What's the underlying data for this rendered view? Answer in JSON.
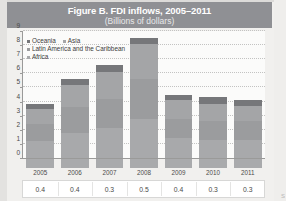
{
  "figure": {
    "title": "Figure B. FDI inflows, 2005–2011",
    "subtitle": "(Billions of dollars)"
  },
  "legend": {
    "items": [
      {
        "label": "Oceania",
        "color": "#76777a"
      },
      {
        "label": "Asia",
        "color": "#a4a5a7"
      },
      {
        "label": "Latin America and the Caribbean",
        "color": "#9b9c9e"
      },
      {
        "label": "Africa",
        "color": "#a8a9ab"
      }
    ]
  },
  "y_axis": {
    "ticks": [
      "9",
      "8",
      "7",
      "6",
      "5",
      "4",
      "3",
      "2",
      "1",
      "0"
    ]
  },
  "bottom_row": {
    "values": [
      "0.4",
      "0.4",
      "0.3",
      "0.5",
      "0.4",
      "0.3",
      "0.3"
    ]
  },
  "corner": {
    "scrap": "S"
  },
  "chart_data": {
    "type": "bar",
    "title": "Figure B. FDI inflows, 2005–2011",
    "subtitle": "(Billions of dollars)",
    "xlabel": "",
    "ylabel": "Billions of dollars",
    "ylim": [
      0,
      9
    ],
    "grid": true,
    "stacked": true,
    "legend_position": "inside-top-left",
    "categories": [
      "2005",
      "2006",
      "2007",
      "2008",
      "2009",
      "2010",
      "2011"
    ],
    "series": [
      {
        "name": "Africa",
        "values": [
          1.2,
          1.8,
          2.1,
          2.8,
          1.4,
          1.3,
          1.3
        ]
      },
      {
        "name": "Latin America and the Caribbean",
        "values": [
          1.2,
          1.8,
          2.1,
          2.8,
          1.4,
          1.3,
          1.3
        ]
      },
      {
        "name": "Asia",
        "values": [
          1.1,
          1.6,
          1.9,
          2.5,
          1.3,
          1.2,
          1.1
        ]
      },
      {
        "name": "Oceania",
        "values": [
          0.3,
          0.4,
          0.5,
          0.4,
          0.4,
          0.5,
          0.4
        ]
      }
    ],
    "totals": [
      3.8,
      5.6,
      6.6,
      8.5,
      4.5,
      4.3,
      4.1
    ],
    "data_row_label": "",
    "data_row_values": [
      0.4,
      0.4,
      0.3,
      0.5,
      0.4,
      0.3,
      0.3
    ]
  }
}
